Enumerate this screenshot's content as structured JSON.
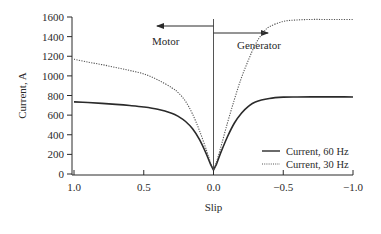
{
  "chart_data": {
    "type": "line",
    "title": "",
    "xlabel": "Slip",
    "ylabel": "Current, A",
    "xlim": [
      1.0,
      -1.0
    ],
    "ylim": [
      0,
      1600
    ],
    "x_ticks": [
      1.0,
      0.5,
      0.0,
      -0.5,
      -1.0
    ],
    "x_tick_labels": [
      "1.0",
      "0.5",
      "0.0",
      "−0.5",
      "−1.0"
    ],
    "y_ticks": [
      0,
      200,
      400,
      600,
      800,
      1000,
      1200,
      1400,
      1600
    ],
    "y_tick_labels": [
      "0",
      "200",
      "400",
      "600",
      "800",
      "1000",
      "1200",
      "1400",
      "1600"
    ],
    "grid": false,
    "legend_position": "bottom-right",
    "annotations": [
      {
        "text": "Motor",
        "arrow_direction": "left"
      },
      {
        "text": "Generator",
        "arrow_direction": "right"
      }
    ],
    "vertical_reference_line_x": 0.0,
    "series": [
      {
        "name": "Current, 60 Hz",
        "style": "solid",
        "color": "#2a2a2a",
        "x": [
          1.0,
          0.9,
          0.8,
          0.7,
          0.6,
          0.5,
          0.4,
          0.3,
          0.25,
          0.2,
          0.15,
          0.1,
          0.05,
          0.02,
          0.0,
          -0.02,
          -0.05,
          -0.1,
          -0.15,
          -0.2,
          -0.25,
          -0.3,
          -0.4,
          -0.5,
          -0.6,
          -0.7,
          -0.8,
          -0.9,
          -1.0
        ],
        "y": [
          735,
          728,
          720,
          710,
          698,
          683,
          660,
          620,
          585,
          535,
          460,
          350,
          200,
          95,
          40,
          95,
          210,
          380,
          520,
          620,
          690,
          735,
          770,
          783,
          785,
          786,
          786,
          786,
          785
        ]
      },
      {
        "name": "Current, 30 Hz",
        "style": "dotted",
        "color": "#555555",
        "x": [
          1.0,
          0.9,
          0.8,
          0.7,
          0.6,
          0.5,
          0.4,
          0.3,
          0.25,
          0.2,
          0.15,
          0.1,
          0.05,
          0.02,
          0.0,
          -0.02,
          -0.05,
          -0.1,
          -0.15,
          -0.2,
          -0.25,
          -0.3,
          -0.35,
          -0.4,
          -0.5,
          -0.6,
          -0.7,
          -0.8,
          -0.9,
          -1.0
        ],
        "y": [
          1170,
          1140,
          1115,
          1085,
          1055,
          1020,
          960,
          880,
          825,
          740,
          610,
          440,
          240,
          110,
          40,
          115,
          260,
          520,
          760,
          980,
          1160,
          1320,
          1430,
          1500,
          1555,
          1570,
          1575,
          1575,
          1575,
          1575
        ]
      }
    ]
  }
}
